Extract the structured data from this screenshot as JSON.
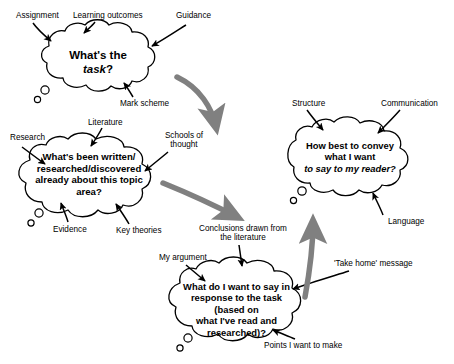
{
  "diagram": {
    "bubbles": [
      {
        "id": "task",
        "lines": [
          "What's the ",
          "task",
          "?"
        ],
        "text_plain": "What's the task?"
      },
      {
        "id": "literature",
        "lines": [
          "What's been written/",
          "researched/discovered",
          "already about this topic area?"
        ],
        "text_plain": "What's been written/researched/discovered already about this topic area?"
      },
      {
        "id": "convey",
        "lines": [
          "How best to convey what I want",
          "to say to my reader?"
        ],
        "text_plain": "How best to convey what I want to say to my reader?"
      },
      {
        "id": "argument",
        "lines": [
          "What do I want to say in",
          "response to the task (based on",
          "what I've read and researched)?"
        ],
        "text_plain": "What do I want to say in response to the task (based on what I've read and researched)?"
      }
    ],
    "labels": {
      "assignment": "Assignment",
      "learning_outcomes": "Learning outcomes",
      "guidance": "Guidance",
      "mark_scheme": "Mark scheme",
      "research": "Research",
      "literature": "Literature",
      "schools_of_thought": "Schools of\nthought",
      "evidence": "Evidence",
      "key_theories": "Key theories",
      "structure": "Structure",
      "communication": "Communication",
      "language": "Language",
      "conclusions": "Conclusions drawn from\nthe literature",
      "my_argument": "My argument",
      "take_home": "'Take home' message",
      "points_to_make": "Points I want to make"
    },
    "colors": {
      "stroke": "#000000",
      "bubble_fill": "#ffffff",
      "arrow_gray": "#808080",
      "background": "#ffffff"
    }
  }
}
